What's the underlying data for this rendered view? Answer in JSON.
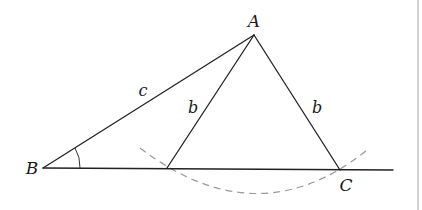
{
  "diagram": {
    "points": {
      "A": {
        "label": "A",
        "x": 254,
        "y": 35,
        "label_x": 254,
        "label_y": 27
      },
      "B": {
        "label": "B",
        "x": 43,
        "y": 168,
        "label_x": 32,
        "label_y": 174
      },
      "C": {
        "label": "C",
        "x": 340,
        "y": 170,
        "label_x": 346,
        "label_y": 191
      },
      "C_prime": {
        "label": "",
        "x": 167,
        "y": 168
      }
    },
    "sides": {
      "c": {
        "label": "c",
        "label_x": 143,
        "label_y": 96
      },
      "b_left": {
        "label": "b",
        "label_x": 193,
        "label_y": 113
      },
      "b_right": {
        "label": "b",
        "label_x": 317,
        "label_y": 113
      }
    },
    "baseline_end_x": 393,
    "colors": {
      "line": "#222222",
      "arc": "#9a9a9a",
      "border": "#b5b5b5",
      "background": "#ffffff"
    }
  }
}
